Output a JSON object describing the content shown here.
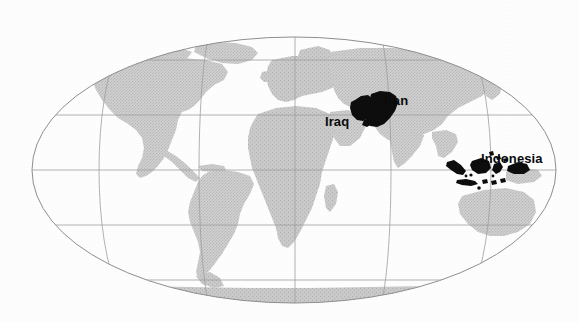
{
  "figure": {
    "kind": "world-map",
    "projection": "elliptical",
    "background_color": "#ffffff",
    "land_color": "#c9c9c9",
    "land_texture": "halftone-stipple",
    "graticule_color": "#9a9a9a",
    "highlight_color": "#0d0d0d",
    "width": 579,
    "height": 322
  },
  "graticule": {
    "latitude_lines": 5,
    "meridian_lines": 7,
    "equator_y": 170,
    "central_meridian_x": 295,
    "ellipse": {
      "cx": 294,
      "cy": 170,
      "rx": 262,
      "ry": 133
    }
  },
  "highlights": [
    {
      "id": "iraq",
      "label": "Iraq"
    },
    {
      "id": "iran",
      "label": "Iran"
    },
    {
      "id": "indonesia",
      "label": "Indonesia"
    }
  ],
  "labels": {
    "iran": "Iran",
    "iraq": "Iraq",
    "indonesia": "Indonesia"
  },
  "landmasses": [
    "North America",
    "South America",
    "Greenland",
    "Europe",
    "Africa",
    "Asia",
    "Australia",
    "Antarctica"
  ]
}
